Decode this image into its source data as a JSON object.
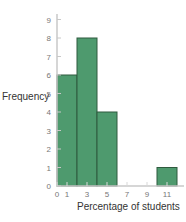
{
  "chart_data": {
    "type": "bar",
    "title": "",
    "xlabel": "Percentage of students",
    "ylabel": "Frequency",
    "bins": [
      {
        "start": 0,
        "end": 2,
        "value": 6
      },
      {
        "start": 2,
        "end": 4,
        "value": 8
      },
      {
        "start": 4,
        "end": 6,
        "value": 4
      },
      {
        "start": 6,
        "end": 8,
        "value": 0
      },
      {
        "start": 8,
        "end": 10,
        "value": 0
      },
      {
        "start": 10,
        "end": 12,
        "value": 1
      }
    ],
    "categories": [
      "0-2",
      "2-4",
      "4-6",
      "6-8",
      "8-10",
      "10-12"
    ],
    "values": [
      6,
      8,
      4,
      0,
      0,
      1
    ],
    "x_ticks": [
      "0",
      "1",
      "3",
      "5",
      "7",
      "9",
      "11"
    ],
    "y_ticks": [
      "0",
      "1",
      "2",
      "3",
      "4",
      "5",
      "6",
      "7",
      "8",
      "9"
    ],
    "xlim": [
      0,
      12
    ],
    "ylim": [
      0,
      9
    ],
    "grid": false,
    "legend": null,
    "bar_color": "#4e9a6e",
    "bar_edge_color": "#2f5a3e",
    "axis_color": "#c8c8c8"
  }
}
